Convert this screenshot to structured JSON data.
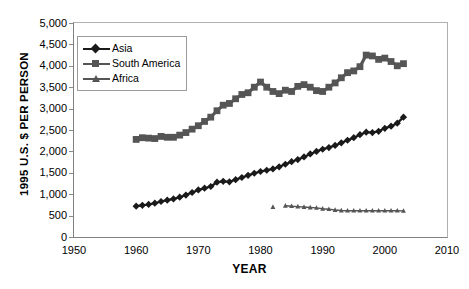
{
  "chart_data": {
    "type": "line",
    "title": "",
    "xlabel": "YEAR",
    "ylabel": "1995 U.S. $ PER PERSON",
    "xlim": [
      1950,
      2010
    ],
    "ylim": [
      0,
      5000
    ],
    "xticks": [
      "1950",
      "1960",
      "1970",
      "1980",
      "1990",
      "2000",
      "2010"
    ],
    "yticks": [
      "0",
      "500",
      "1,000",
      "1,500",
      "2,000",
      "2,500",
      "3,000",
      "3,500",
      "4,000",
      "4,500",
      "5,000"
    ],
    "grid": false,
    "legend_position": "upper-left-inside",
    "series": [
      {
        "name": "Asia",
        "marker": "diamond",
        "color": "#1a1a1a",
        "x": [
          1960,
          1961,
          1962,
          1963,
          1964,
          1965,
          1966,
          1967,
          1968,
          1969,
          1970,
          1971,
          1972,
          1973,
          1974,
          1975,
          1976,
          1977,
          1978,
          1979,
          1980,
          1981,
          1982,
          1983,
          1984,
          1985,
          1986,
          1987,
          1988,
          1989,
          1990,
          1991,
          1992,
          1993,
          1994,
          1995,
          1996,
          1997,
          1998,
          1999,
          2000,
          2001,
          2002,
          2003
        ],
        "values": [
          720,
          740,
          760,
          790,
          830,
          860,
          890,
          930,
          980,
          1040,
          1100,
          1140,
          1180,
          1280,
          1300,
          1290,
          1340,
          1390,
          1440,
          1490,
          1530,
          1560,
          1590,
          1640,
          1700,
          1760,
          1810,
          1870,
          1940,
          2000,
          2050,
          2090,
          2140,
          2200,
          2260,
          2320,
          2390,
          2450,
          2440,
          2470,
          2540,
          2590,
          2660,
          2800
        ]
      },
      {
        "name": "South America",
        "marker": "square",
        "color": "#555555",
        "x": [
          1960,
          1961,
          1962,
          1963,
          1964,
          1965,
          1966,
          1967,
          1968,
          1969,
          1970,
          1971,
          1972,
          1973,
          1974,
          1975,
          1976,
          1977,
          1978,
          1979,
          1980,
          1981,
          1982,
          1983,
          1984,
          1985,
          1986,
          1987,
          1988,
          1989,
          1990,
          1991,
          1992,
          1993,
          1994,
          1995,
          1996,
          1997,
          1998,
          1999,
          2000,
          2001,
          2002,
          2003
        ],
        "values": [
          2280,
          2320,
          2310,
          2300,
          2350,
          2330,
          2330,
          2380,
          2440,
          2520,
          2600,
          2700,
          2800,
          2950,
          3080,
          3120,
          3230,
          3330,
          3370,
          3500,
          3620,
          3500,
          3400,
          3350,
          3430,
          3400,
          3520,
          3560,
          3500,
          3420,
          3400,
          3500,
          3600,
          3720,
          3840,
          3880,
          3980,
          4250,
          4230,
          4150,
          4180,
          4100,
          4000,
          4050
        ]
      },
      {
        "name": "Africa",
        "marker": "triangle",
        "color": "#555555",
        "x": [
          1982,
          1984,
          1985,
          1986,
          1987,
          1988,
          1989,
          1990,
          1991,
          1992,
          1993,
          1994,
          1995,
          1996,
          1997,
          1998,
          1999,
          2000,
          2001,
          2002,
          2003
        ],
        "values": [
          700,
          730,
          720,
          710,
          700,
          690,
          680,
          660,
          650,
          630,
          620,
          615,
          615,
          615,
          615,
          615,
          615,
          615,
          615,
          615,
          610
        ]
      }
    ]
  },
  "legend": {
    "items": [
      {
        "label": "Asia"
      },
      {
        "label": "South America"
      },
      {
        "label": "Africa"
      }
    ]
  }
}
